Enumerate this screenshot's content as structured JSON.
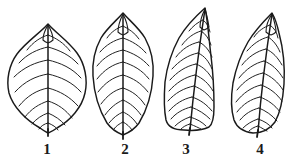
{
  "figure": {
    "background_color": "#ffffff",
    "ink_color": "#1a1a1a",
    "width": 291,
    "height": 162,
    "caption": ""
  },
  "leaves": [
    {
      "label": "1",
      "label_x": 47,
      "label_y": 154,
      "shape_name": "ovate-elliptic leaf",
      "vein_pairs": 8,
      "apex_x": 48,
      "apex_y": 24,
      "base_x": 48,
      "base_y": 131,
      "left_edge_x": 8,
      "right_edge_x": 84,
      "widest_y": 76,
      "outline_path": "M48,24 C40,33 26,42 17,54 C9,65 6,80 9,93 C13,107 26,120 40,128 C44,131 46,132 48,133 C50,132 53,131 57,128 C71,120 82,107 85,93 C88,80 85,64 77,53 C68,41 56,33 48,24 Z",
      "midrib_path": "M48,26 C48,50 48,80 48,131",
      "veins": [
        "M48,35 C41,37 33,42 27,50",
        "M48,35 C56,38 64,43 70,51",
        "M48,47 C38,49 27,54 19,63",
        "M48,47 C59,50 70,55 78,64",
        "M48,60 C36,62 24,67 14,77",
        "M48,60 C61,63 72,68 81,78",
        "M48,74 C36,76 25,81 15,92",
        "M48,74 C61,77 72,82 81,92",
        "M48,88 C37,90 27,96 19,106",
        "M48,88 C60,91 70,97 78,106",
        "M48,101 C39,104 31,109 25,117",
        "M48,101 C58,104 66,110 72,118",
        "M48,113 C42,115 36,119 32,124",
        "M48,113 C55,116 61,120 65,125",
        "M48,123 C44,124 41,126 39,129",
        "M48,123 C53,125 56,127 58,130"
      ],
      "apex_detail_path": "M48,25 C45,30 43,35 43,40 C45,42 48,43 48,43 C48,43 51,42 53,40 C53,35 51,30 48,25",
      "petiole_path": "M48,129 L48,136"
    },
    {
      "label": "2",
      "label_x": 125,
      "label_y": 154,
      "shape_name": "elliptic to obovate leaf",
      "vein_pairs": 9,
      "apex_x": 123,
      "apex_y": 13,
      "base_x": 123,
      "base_y": 134,
      "left_edge_x": 93,
      "right_edge_x": 154,
      "widest_y": 62,
      "outline_path": "M123,13 C117,20 107,28 101,38 C95,49 92,62 93,76 C94,92 99,110 107,123 C112,130 118,133 123,135 C128,133 134,130 139,123 C147,110 152,92 153,76 C154,62 151,49 145,38 C139,28 129,20 123,13 Z",
      "midrib_path": "M123,15 C123,45 123,95 123,135",
      "veins": [
        "M123,26 C117,28 111,32 107,38",
        "M123,26 C129,29 135,33 139,39",
        "M123,38 C114,40 106,45 100,52",
        "M123,38 C132,41 140,46 146,53",
        "M123,50 C113,52 104,57 97,66",
        "M123,50 C133,53 142,58 149,66",
        "M123,62 C113,64 104,70 97,79",
        "M123,62 C133,65 142,70 149,79",
        "M123,75 C113,77 105,83 98,92",
        "M123,75 C133,78 141,83 148,92",
        "M123,88 C114,90 107,96 101,104",
        "M123,88 C132,91 139,96 145,105",
        "M123,100 C116,103 110,108 105,115",
        "M123,100 C130,103 136,108 141,115",
        "M123,112 C118,114 113,118 109,123",
        "M123,112 C128,114 133,118 137,124",
        "M123,122 C119,124 116,126 114,129",
        "M123,122 C127,124 130,127 132,130"
      ],
      "apex_detail_path": "M123,14 C120,20 118,26 118,32 C120,34 123,35 123,35 C123,35 126,34 128,32 C128,26 126,20 123,14",
      "petiole_path": "M123,132 L123,139"
    },
    {
      "label": "3",
      "label_x": 186,
      "label_y": 154,
      "shape_name": "oblong leaf with truncate base",
      "vein_pairs": 12,
      "apex_x": 205,
      "apex_y": 8,
      "base_x": 190,
      "base_y": 129,
      "left_edge_x": 163,
      "right_edge_x": 214,
      "widest_y": 80,
      "outline_path": "M205,8 C196,16 186,26 179,38 C172,51 167,66 165,82 C164,96 164,110 166,120 C168,127 174,130 184,130 C194,131 203,130 209,127 C213,124 214,117 214,107 C214,92 213,72 211,56 C209,40 208,22 205,8 Z",
      "midrib_path": "M205,9 C201,35 195,75 190,130",
      "veins": [
        "M203,20 C198,22 193,26 189,31",
        "M203,20 C207,23 209,27 210,32",
        "M201,31 C194,33 187,38 182,45",
        "M201,31 C206,34 209,39 211,45",
        "M199,42 C190,44 182,49 176,57",
        "M199,42 C205,45 209,50 212,57",
        "M198,53 C188,55 179,61 172,69",
        "M198,53 C205,56 209,62 212,69",
        "M196,64 C186,66 177,72 170,80",
        "M196,64 C204,67 209,73 213,80",
        "M195,75 C185,77 176,83 169,91",
        "M195,75 C203,78 209,84 213,91",
        "M194,86 C184,88 175,93 168,101",
        "M194,86 C202,89 208,94 213,101",
        "M192,97 C183,99 175,104 169,111",
        "M192,97 C201,100 207,105 212,111",
        "M191,107 C183,109 176,113 171,119",
        "M191,107 C199,110 205,114 210,119",
        "M190,117 C184,119 179,122 175,126",
        "M190,117 C197,119 202,122 206,126",
        "M190,124 C186,125 183,127 181,129",
        "M190,124 C195,126 199,128 201,129"
      ],
      "apex_detail_path": "M205,9 C202,15 200,21 200,27 C202,29 204,30 204,30 C204,30 207,29 209,27 C208,21 207,15 205,9",
      "petiole_path": "M190,128 L189,135"
    },
    {
      "label": "4",
      "label_x": 260,
      "label_y": 154,
      "shape_name": "oblanceolate leaf, oblique",
      "vein_pairs": 10,
      "apex_x": 272,
      "apex_y": 13,
      "base_x": 258,
      "base_y": 131,
      "left_edge_x": 231,
      "right_edge_x": 285,
      "widest_y": 70,
      "outline_path": "M272,13 C264,21 255,30 248,42 C241,54 236,68 233,83 C231,96 231,110 234,120 C237,128 244,132 253,133 C262,133 270,129 275,122 C280,113 283,99 284,84 C285,67 283,48 279,33 C277,24 275,18 272,13 Z",
      "midrib_path": "M272,14 C268,40 262,80 258,132",
      "veins": [
        "M270,25 C264,27 258,31 254,37",
        "M270,25 C274,28 277,32 278,38",
        "M268,37 C260,39 253,44 247,51",
        "M268,37 C273,40 277,45 280,52",
        "M266,49 C257,51 248,57 242,65",
        "M266,49 C273,52 278,58 282,65",
        "M264,61 C255,63 246,69 239,78",
        "M264,61 C272,64 278,70 283,78",
        "M263,73 C253,75 244,81 237,90",
        "M263,73 C271,76 278,82 283,90",
        "M261,85 C252,87 243,93 236,102",
        "M261,85 C270,88 277,94 282,101",
        "M260,97 C251,99 243,104 237,112",
        "M260,97 C268,100 275,105 280,112",
        "M259,108 C251,110 245,114 240,120",
        "M259,108 C266,111 272,115 277,121",
        "M258,119 C252,121 247,124 243,128",
        "M258,119 C264,121 269,124 272,128",
        "M258,126 C254,127 251,129 249,131",
        "M258,126 C262,128 265,130 267,131"
      ],
      "apex_detail_path": "M272,14 C268,20 266,26 266,32 C268,34 271,35 271,35 C271,35 274,34 276,32 C276,26 274,20 272,14",
      "petiole_path": "M258,130 L257,137"
    }
  ]
}
